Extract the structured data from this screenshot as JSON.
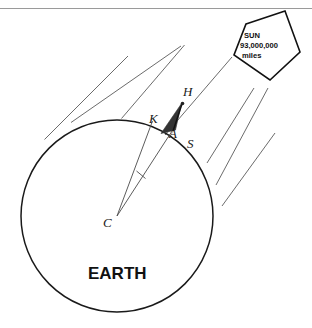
{
  "figure": {
    "title_label": "EARTH",
    "background_color": "#ffffff",
    "stroke_color": "#1a1a1a",
    "ray_color": "#555555",
    "shadow_fill": "#333333",
    "top_rule": {
      "present": true,
      "color": "#999999"
    }
  },
  "sun": {
    "name_label": "SUN",
    "distance_value": "93,000,000",
    "distance_unit": "miles",
    "shape": "pentagon"
  },
  "earth": {
    "label": "EARTH",
    "center_label": "C",
    "center_point": {
      "x": 117,
      "y": 216
    },
    "radius": 96
  },
  "points": [
    {
      "id": "H",
      "label": "H",
      "x": 186,
      "y": 95
    },
    {
      "id": "K",
      "label": "K",
      "x": 152,
      "y": 120
    },
    {
      "id": "A",
      "label": "A",
      "x": 173,
      "y": 133
    },
    {
      "id": "S",
      "label": "S",
      "x": 196,
      "y": 143
    }
  ],
  "rays": {
    "count": 7,
    "description": "parallel sun rays"
  },
  "angle_mark": {
    "present": true,
    "description": "tick across angle at C"
  }
}
